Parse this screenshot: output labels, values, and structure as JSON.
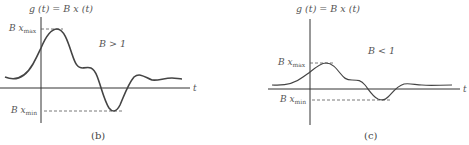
{
  "panels": [
    {
      "id": "b",
      "caption": "(b)",
      "y_axis_label": "g (t) = B x (t)",
      "x_axis_label": "t",
      "condition": "B > 1",
      "max_label": {
        "main": "B x",
        "sub": "max"
      },
      "min_label": {
        "main": "B x",
        "sub": "min"
      }
    },
    {
      "id": "c",
      "caption": "(c)",
      "y_axis_label": "g (t) = B x (t)",
      "x_axis_label": "t",
      "condition": "B < 1",
      "max_label": {
        "main": "B x",
        "sub": "max"
      },
      "min_label": {
        "main": "B x",
        "sub": "min"
      }
    }
  ],
  "colors": {
    "curve": "#444444",
    "axis": "#333333",
    "dashed": "#555555",
    "text": "#555555"
  }
}
